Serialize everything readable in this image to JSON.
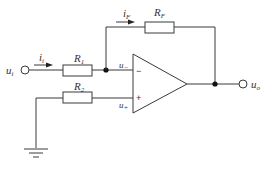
{
  "diagram": {
    "labels": {
      "input_voltage": {
        "main": "u",
        "sub": "i"
      },
      "input_current": {
        "main": "i",
        "sub": "i"
      },
      "feedback_current": {
        "main": "i",
        "sub": "F"
      },
      "r1": {
        "main": "R",
        "sub": "1"
      },
      "r2": {
        "main": "R",
        "sub": "2"
      },
      "rf": {
        "main": "R",
        "sub": "F"
      },
      "inverting_input": {
        "main": "u",
        "sub": "−"
      },
      "noninverting_input": {
        "main": "u",
        "sub": "+"
      },
      "output_voltage": {
        "main": "u",
        "sub": "o"
      },
      "minus_sign": "−",
      "plus_sign": "+"
    },
    "colors": {
      "wire": "#3a3a3a",
      "node": "#111111",
      "text": "#333333",
      "background": "#ffffff"
    }
  }
}
